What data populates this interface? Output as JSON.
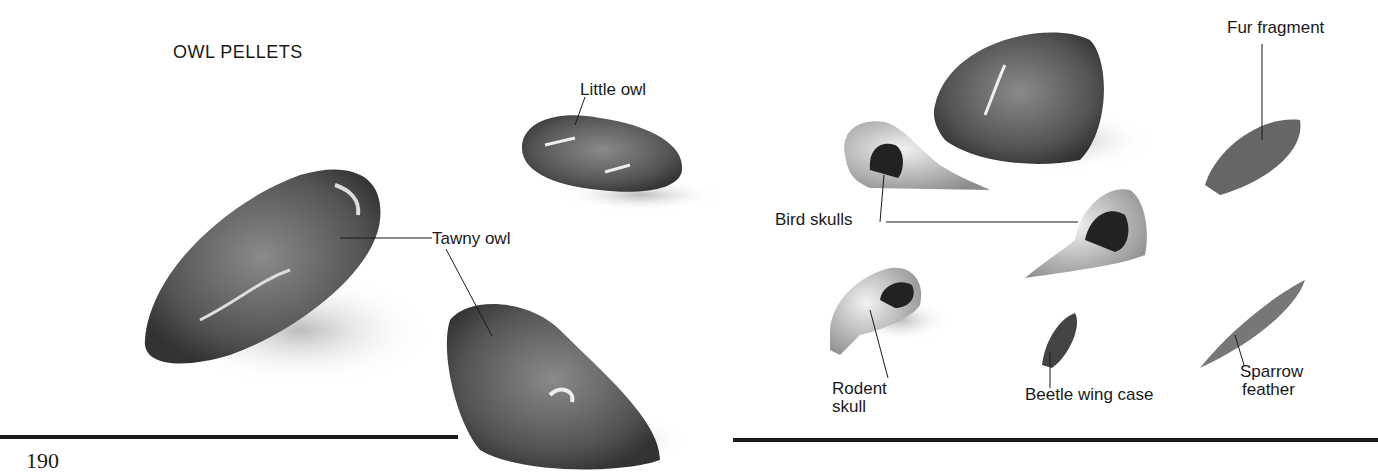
{
  "page": {
    "title": "OWL PELLETS",
    "page_number": "190"
  },
  "labels": {
    "little_owl": "Little owl",
    "tawny_owl": "Tawny owl",
    "fur_fragment": "Fur fragment",
    "bird_skulls": "Bird skulls",
    "rodent_skull_line1": "Rodent",
    "rodent_skull_line2": "skull",
    "beetle_wing_case": "Beetle wing case",
    "sparrow_feather_line1": "Sparrow",
    "sparrow_feather_line2": "feather"
  }
}
